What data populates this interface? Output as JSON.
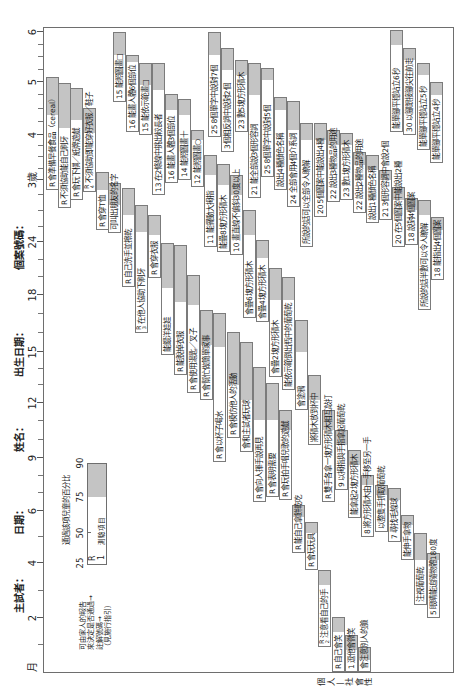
{
  "header": {
    "examiner": "主試者：",
    "date": "日期：",
    "name": "姓名：",
    "birth_date": "出生日期：",
    "case_number": "個案號碼："
  },
  "report_marker": "R",
  "age_axis": {
    "labels": [
      {
        "text": "月",
        "u": 33,
        "tick": false
      },
      {
        "text": "2",
        "u": 82,
        "tick": true
      },
      {
        "text": "4",
        "u": 137,
        "tick": true
      },
      {
        "text": "6",
        "u": 189,
        "tick": true
      },
      {
        "text": "9",
        "u": 242,
        "tick": true
      },
      {
        "text": "12",
        "u": 297,
        "tick": true
      },
      {
        "text": "15",
        "u": 348,
        "tick": true
      },
      {
        "text": "18",
        "u": 405,
        "tick": true
      },
      {
        "text": "24",
        "u": 458,
        "tick": true
      },
      {
        "text": "3歲",
        "u": 520,
        "tick": true
      },
      {
        "text": "4",
        "u": 565,
        "tick": true
      },
      {
        "text": "5",
        "u": 618,
        "tick": true
      },
      {
        "text": "6",
        "u": 668,
        "tick": true
      }
    ],
    "minor_ticks": [
      55,
      109,
      163,
      207,
      224,
      260,
      279,
      315,
      331,
      367,
      386,
      423,
      440,
      473,
      489,
      505,
      531,
      543,
      554,
      578,
      591,
      605,
      630,
      643,
      655
    ]
  },
  "legend": {
    "percent_caption": "通過該項兒童的百分比",
    "percent_ticks": [
      "25",
      "50",
      "75",
      "90"
    ],
    "sample_report": "R",
    "sample_note": "1",
    "sample_item": "測驗項目",
    "explanation_lines": [
      "可由家人的報告",
      "來決定是否通過→",
      "註解號碼→",
      "（見施行指引）"
    ]
  },
  "sections": [
    {
      "id": "personal_social",
      "label": "個人—社會性",
      "items": [
        {
          "r": true,
          "note": "",
          "text": "會準備早餐食品（cereal）",
          "v": 46,
          "p25": 510,
          "p75": 585,
          "p90": 623
        },
        {
          "r": true,
          "note": "",
          "text": "不須協助能自己刷牙",
          "v": 58,
          "p25": 492,
          "p75": 572,
          "p90": 617
        },
        {
          "r": true,
          "note": "",
          "text": "會玩下棋／紙牌遊戲",
          "v": 70,
          "p25": 500,
          "p75": 580,
          "p90": 612
        },
        {
          "r": true,
          "note": "4",
          "text": "不須協助即能穿好衣服／鞋子",
          "v": 83,
          "p25": 508,
          "p75": 567,
          "p90": 592
        },
        {
          "r": true,
          "note": "",
          "text": "會穿T恤",
          "v": 96,
          "p25": 470,
          "p75": 510,
          "p90": 528
        },
        {
          "r": false,
          "note": "",
          "text": "可叫出朋友的名字",
          "v": 108,
          "p25": 467,
          "p75": 495,
          "p90": 517
        },
        {
          "r": true,
          "note": "",
          "text": "自己洗手並擦乾",
          "v": 122,
          "p25": 413,
          "p75": 485,
          "p90": 512
        },
        {
          "r": true,
          "note": "3",
          "text": "在他人協助下刷牙",
          "v": 135,
          "p25": 367,
          "p75": 468,
          "p90": 495
        },
        {
          "r": true,
          "note": "",
          "text": "會穿衣服",
          "v": 148,
          "p25": 422,
          "p75": 465,
          "p90": 485
        },
        {
          "r": false,
          "note": "",
          "text": "能餵洋娃娃",
          "v": 161,
          "p25": 345,
          "p75": 412,
          "p90": 457
        },
        {
          "r": true,
          "note": "",
          "text": "能脫掉衣服",
          "v": 174,
          "p25": 325,
          "p75": 398,
          "p90": 455
        },
        {
          "r": true,
          "note": "",
          "text": "會使用湯匙／叉子",
          "v": 187,
          "p25": 307,
          "p75": 395,
          "p90": 425
        },
        {
          "r": true,
          "note": "",
          "text": "會幫忙做簡單家事",
          "v": 200,
          "p25": 300,
          "p75": 355,
          "p90": 390
        },
        {
          "r": true,
          "note": "",
          "text": "會以杯子喝水",
          "v": 213,
          "p25": 238,
          "p75": 353,
          "p90": 387
        },
        {
          "r": true,
          "note": "",
          "text": "會模仿他人的活動",
          "v": 227,
          "p25": 262,
          "p75": 315,
          "p90": 368
        },
        {
          "r": false,
          "note": "",
          "text": "會和主試者玩球",
          "v": 240,
          "p25": 248,
          "p75": 300,
          "p90": 358
        },
        {
          "r": true,
          "note": "",
          "text": "會向人揮手說再見",
          "v": 253,
          "p25": 198,
          "p75": 280,
          "p90": 333
        },
        {
          "r": true,
          "note": "",
          "text": "會表明需要",
          "v": 266,
          "p25": 203,
          "p75": 280,
          "p90": 317
        },
        {
          "r": true,
          "note": "",
          "text": "會玩拍手唱兒歌的遊戲",
          "v": 279,
          "p25": 200,
          "p75": 270,
          "p90": 290
        },
        {
          "r": true,
          "note": "",
          "text": "能自己拿餅乾吃",
          "v": 292,
          "p25": 147,
          "p75": 183,
          "p90": 195
        },
        {
          "r": true,
          "note": "",
          "text": "會玩玩具",
          "v": 305,
          "p25": 130,
          "p75": 167,
          "p90": 178
        },
        {
          "r": true,
          "note": "2",
          "text": "注意看自己的手",
          "v": 318,
          "p25": 53,
          "p75": 115,
          "p90": 130
        },
        {
          "r": true,
          "note": "",
          "text": "自己會笑",
          "v": 332,
          "p25": 28,
          "p75": 68,
          "p90": 83
        },
        {
          "r": false,
          "note": "1",
          "text": "逗他會微笑",
          "v": 345,
          "p25": 28,
          "p75": 50,
          "p90": 65
        },
        {
          "r": false,
          "note": "",
          "text": "會注意別人的臉",
          "v": 358,
          "p25": 28,
          "p75": 40,
          "p90": 53
        }
      ]
    },
    {
      "id": "fine_motor_adaptive",
      "items": [
        {
          "r": false,
          "note": "15",
          "text": "能照圖畫□",
          "v": 113,
          "p25": 598,
          "p75": 645,
          "p90": 668
        },
        {
          "r": false,
          "note": "16",
          "text": "能畫人體6個部位",
          "v": 126,
          "p25": 568,
          "p75": 638,
          "p90": 645
        },
        {
          "r": false,
          "note": "15",
          "text": "能依示範畫□",
          "v": 139,
          "p25": 565,
          "p75": 615,
          "p90": 637
        },
        {
          "r": false,
          "note": "13",
          "text": "在2條線中挑出較長者",
          "v": 152,
          "p25": 505,
          "p75": 610,
          "p90": 637
        },
        {
          "r": false,
          "note": "16",
          "text": "能畫人體3個部位",
          "v": 165,
          "p25": 517,
          "p75": 590,
          "p90": 606
        },
        {
          "r": false,
          "note": "14",
          "text": "能照圖畫十",
          "v": 178,
          "p25": 520,
          "p75": 585,
          "p90": 601
        },
        {
          "r": false,
          "note": "12",
          "text": "能照圖畫○",
          "v": 191,
          "p25": 513,
          "p75": 560,
          "p90": 570
        },
        {
          "r": false,
          "note": "11",
          "text": "能擺動大拇指",
          "v": 204,
          "p25": 453,
          "p75": 525,
          "p90": 545
        },
        {
          "r": false,
          "note": "",
          "text": "能疊8塊方形積木",
          "v": 217,
          "p25": 448,
          "p75": 515,
          "p90": 536
        },
        {
          "r": false,
          "note": "10",
          "text": "畫直線不偏斜30度以上",
          "v": 230,
          "p25": 445,
          "p75": 505,
          "p90": 525
        },
        {
          "r": false,
          "note": "",
          "text": "會疊6塊方形積木",
          "v": 243,
          "p25": 382,
          "p75": 465,
          "p90": 490
        },
        {
          "r": false,
          "note": "",
          "text": "會疊4塊方形積木",
          "v": 256,
          "p25": 378,
          "p75": 442,
          "p90": 460
        },
        {
          "r": false,
          "note": "",
          "text": "會疊2塊方形積木",
          "v": 269,
          "p25": 323,
          "p75": 400,
          "p90": 432
        },
        {
          "r": false,
          "note": "",
          "text": "能依示範倒出瓶中的葡萄乾",
          "v": 282,
          "p25": 310,
          "p75": 400,
          "p90": 423
        },
        {
          "r": false,
          "note": "",
          "text": "會塗鴉",
          "v": 295,
          "p25": 290,
          "p75": 348,
          "p90": 380
        },
        {
          "r": false,
          "note": "",
          "text": "將積木放到杯中",
          "v": 308,
          "p25": 255,
          "p75": 300,
          "p90": 325
        },
        {
          "r": true,
          "note": "",
          "text": "雙手各拿一塊方形積木相互敲打",
          "v": 322,
          "p25": 198,
          "p75": 270,
          "p90": 290
        },
        {
          "r": false,
          "note": "9",
          "text": "以拇指與手指拿起葡萄乾",
          "v": 335,
          "p25": 210,
          "p75": 255,
          "p90": 270
        },
        {
          "r": false,
          "note": "",
          "text": "能拿起2塊方形積木",
          "v": 348,
          "p25": 182,
          "p75": 235,
          "p90": 250
        },
        {
          "r": false,
          "note": "8",
          "text": "將方形積木由一手移至另一手",
          "v": 361,
          "p25": 163,
          "p75": 215,
          "p90": 225
        },
        {
          "r": false,
          "note": "",
          "text": "以整隻手抓取葡萄乾",
          "v": 375,
          "p25": 168,
          "p75": 205,
          "p90": 215
        },
        {
          "r": false,
          "note": "7",
          "text": "尋找毛線球",
          "v": 388,
          "p25": 158,
          "p75": 200,
          "p90": 212
        },
        {
          "r": false,
          "note": "",
          "text": "能伸手拿物",
          "v": 401,
          "p25": 140,
          "p75": 175,
          "p90": 185
        },
        {
          "r": false,
          "note": "",
          "text": "注視葡萄乾",
          "v": 414,
          "p25": 95,
          "p75": 140,
          "p90": 167
        },
        {
          "r": false,
          "note": "5",
          "text": "眼睛能追隨物體180度",
          "v": 427,
          "p25": 82,
          "p75": 140,
          "p90": 147
        }
      ]
    },
    {
      "id": "language",
      "items": [
        {
          "r": false,
          "note": "25",
          "text": "8個單字中說對7個",
          "v": 208,
          "p25": 563,
          "p75": 645,
          "p90": 668
        },
        {
          "r": false,
          "note": "",
          "text": "3個相反詞中說對2個",
          "v": 221,
          "p25": 548,
          "p75": 630,
          "p90": 652
        },
        {
          "r": false,
          "note": "23",
          "text": "數5塊方形積木",
          "v": 235,
          "p25": 568,
          "p75": 625,
          "p90": 640
        },
        {
          "r": false,
          "note": "21",
          "text": "能全部說3個形容詞",
          "v": 248,
          "p25": 502,
          "p75": 605,
          "p90": 637
        },
        {
          "r": false,
          "note": "25",
          "text": "8個單字中說對5個",
          "v": 261,
          "p25": 523,
          "p75": 620,
          "p90": 632
        },
        {
          "r": false,
          "note": "",
          "text": "說出4種顏色名稱",
          "v": 274,
          "p25": 510,
          "p75": 590,
          "p90": 603
        },
        {
          "r": false,
          "note": "24",
          "text": "全部會用4個介系詞",
          "v": 287,
          "p25": 493,
          "p75": 570,
          "p90": 599
        },
        {
          "r": false,
          "note": "",
          "text": "所說的話可以全部令人瞭解",
          "v": 300,
          "p25": 453,
          "p75": 560,
          "p90": 577
        },
        {
          "r": false,
          "note": "20",
          "text": "5個圖案中能說出4種",
          "v": 314,
          "p25": 483,
          "p75": 560,
          "p90": 577
        },
        {
          "r": false,
          "note": "22",
          "text": "說出3種物品的用途",
          "v": 327,
          "p25": 498,
          "p75": 555,
          "p90": 570
        },
        {
          "r": false,
          "note": "23",
          "text": "數1塊方形積木",
          "v": 340,
          "p25": 500,
          "p75": 555,
          "p90": 567
        },
        {
          "r": false,
          "note": "22",
          "text": "說出2種物品的用途",
          "v": 353,
          "p25": 487,
          "p75": 535,
          "p90": 548
        },
        {
          "r": false,
          "note": "",
          "text": "說出1種顏色名稱",
          "v": 366,
          "p25": 477,
          "p75": 530,
          "p90": 545
        },
        {
          "r": false,
          "note": "21",
          "text": "3個形容詞中會說2個",
          "v": 379,
          "p25": 480,
          "p75": 520,
          "p90": 530
        },
        {
          "r": false,
          "note": "20",
          "text": "在5個圖案中能說出2種",
          "v": 392,
          "p25": 453,
          "p75": 500,
          "p90": 513
        },
        {
          "r": false,
          "note": "18",
          "text": "說對4個圖案",
          "v": 405,
          "p25": 455,
          "p75": 490,
          "p90": 502
        },
        {
          "r": false,
          "note": "",
          "text": "所說的話半數可以令人瞭解",
          "v": 418,
          "p25": 390,
          "p75": 485,
          "p90": 500
        },
        {
          "r": false,
          "note": "18",
          "text": "能指出4個圖案",
          "v": 431,
          "p25": 420,
          "p75": 470,
          "p90": 483
        }
      ]
    },
    {
      "id": "gross_motor",
      "items": [
        {
          "r": false,
          "note": "",
          "text": "能單腳平穩站立6秒",
          "v": 390,
          "p25": 568,
          "p75": 655,
          "p90": 670
        },
        {
          "r": false,
          "note": "30",
          "text": "以腳跟接腳尖往前走",
          "v": 403,
          "p25": 565,
          "p75": 640,
          "p90": 652
        },
        {
          "r": false,
          "note": "",
          "text": "能單腳平穩站立5秒",
          "v": 417,
          "p25": 550,
          "p75": 625,
          "p90": 637
        },
        {
          "r": false,
          "note": "",
          "text": "能單腳平穩站立4秒",
          "v": 430,
          "p25": 537,
          "p75": 605,
          "p90": 618
        }
      ]
    }
  ]
}
